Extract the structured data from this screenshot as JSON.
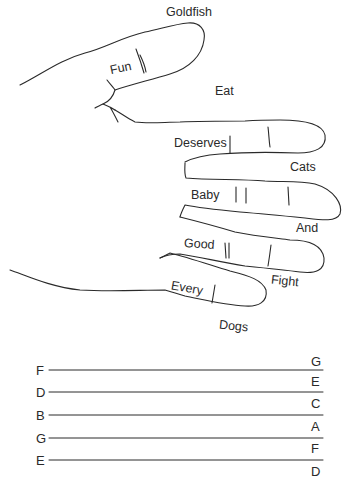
{
  "hand_mnemonic": {
    "description": "Hand drawing with words on fingers and gaps",
    "finger_words": [
      "Goldfish",
      "Fun",
      "Eat",
      "Deserves",
      "Cats",
      "Baby",
      "And",
      "Good",
      "Fight",
      "Every",
      "Dogs"
    ]
  },
  "labels": {
    "goldfish": "Goldfish",
    "fun": "Fun",
    "eat": "Eat",
    "deserves": "Deserves",
    "cats": "Cats",
    "baby": "Baby",
    "and": "And",
    "good": "Good",
    "fight": "Fight",
    "every": "Every",
    "dogs": "Dogs"
  },
  "staff": {
    "line_notes": [
      "F",
      "D",
      "B",
      "G",
      "E"
    ],
    "space_notes": [
      "G",
      "E",
      "C",
      "A",
      "F",
      "D"
    ]
  },
  "colors": {
    "stroke": "#2a2a2a",
    "background": "#ffffff"
  }
}
